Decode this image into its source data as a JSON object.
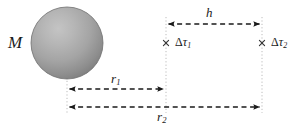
{
  "figure": {
    "name": "gravitational-time-dilation-diagram",
    "width": 289,
    "height": 126,
    "background_color": "#ffffff",
    "ink_color": "#1a1a1a",
    "guide_color": "#b9b9b9"
  },
  "mass": {
    "label": "M",
    "shape": "sphere",
    "center_x": 67,
    "center_y": 43,
    "radius": 36,
    "fill_light": "#bdbdbd",
    "fill_mid": "#a2a2a2",
    "fill_dark": "#7c7c7c",
    "edge_color": "#6f6f6f"
  },
  "observers": [
    {
      "id": "observer-1",
      "marker": "x",
      "label_delta": "Δ",
      "label_tau": "τ",
      "label_index": "1",
      "x": 166,
      "y": 43
    },
    {
      "id": "observer-2",
      "marker": "x",
      "label_delta": "Δ",
      "label_tau": "τ",
      "label_index": "2",
      "x": 262,
      "y": 43
    }
  ],
  "measures": [
    {
      "id": "height-h",
      "label_base": "h",
      "label_index": "",
      "x_start": 166,
      "x_end": 262,
      "y": 24,
      "label_x": 211,
      "label_y": 13,
      "arrow_style": "dashed-double-headed"
    },
    {
      "id": "radius-r1",
      "label_base": "r",
      "label_index": "1",
      "x_start": 67,
      "x_end": 166,
      "y": 89,
      "label_x": 116,
      "label_y": 79,
      "arrow_style": "dashed-double-headed"
    },
    {
      "id": "radius-r2",
      "label_base": "r",
      "label_index": "2",
      "x_start": 67,
      "x_end": 262,
      "y": 107,
      "label_x": 164,
      "label_y": 117,
      "arrow_style": "dashed-double-headed"
    }
  ],
  "guides": [
    {
      "id": "guide-sphere-center",
      "x": 67,
      "y_start": 74,
      "y_end": 113
    },
    {
      "id": "guide-observer-1",
      "x": 166,
      "y_start": 17,
      "y_end": 113
    },
    {
      "id": "guide-observer-2",
      "x": 262,
      "y_start": 17,
      "y_end": 113
    }
  ]
}
